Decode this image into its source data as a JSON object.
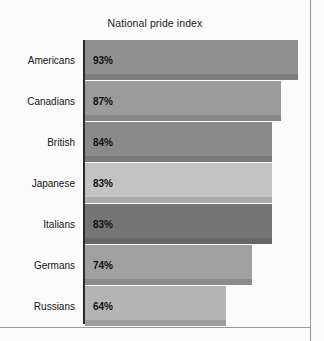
{
  "chart_data": {
    "type": "bar",
    "orientation": "horizontal",
    "title": "National pride index",
    "xlabel": "",
    "ylabel": "",
    "categories": [
      "Americans",
      "Canadians",
      "British",
      "Japanese",
      "Italians",
      "Germans",
      "Russians"
    ],
    "values": [
      93,
      87,
      84,
      83,
      83,
      74,
      64
    ],
    "value_labels": [
      "93%",
      "87%",
      "84%",
      "83%",
      "83%",
      "74%",
      "64%"
    ],
    "xlim": [
      0,
      100
    ],
    "grid": false,
    "legend": null,
    "bar_colors": [
      "#8f8f8f",
      "#9b9b9b",
      "#8a8a8a",
      "#c3c3c3",
      "#757575",
      "#a0a0a0",
      "#b4b4b4"
    ],
    "axis_color": "#2a2a2a",
    "background": "#fbfbfb"
  },
  "chart": {
    "title": "National pride index",
    "bars": [
      {
        "category": "Americans",
        "value": 93,
        "label": "93%",
        "color": "#8f8f8f",
        "width_px": 213
      },
      {
        "category": "Canadians",
        "value": 87,
        "label": "87%",
        "color": "#9b9b9b",
        "width_px": 196
      },
      {
        "category": "British",
        "value": 84,
        "label": "84%",
        "color": "#8a8a8a",
        "width_px": 187
      },
      {
        "category": "Japanese",
        "value": 83,
        "label": "83%",
        "color": "#c3c3c3",
        "width_px": 187
      },
      {
        "category": "Italians",
        "value": 83,
        "label": "83%",
        "color": "#757575",
        "width_px": 187
      },
      {
        "category": "Germans",
        "value": 74,
        "label": "74%",
        "color": "#a0a0a0",
        "width_px": 167
      },
      {
        "category": "Russians",
        "value": 64,
        "label": "64%",
        "color": "#b4b4b4",
        "width_px": 141
      }
    ]
  }
}
